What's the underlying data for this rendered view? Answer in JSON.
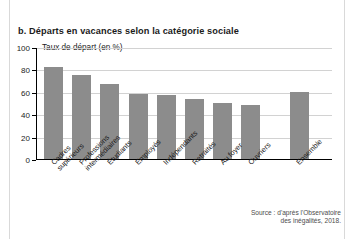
{
  "figure": {
    "title": "b. Départs en vacances selon la catégorie sociale",
    "axis_label": "Taux de départ (en %)",
    "source_line1": "Source : d'après l'Observatoire",
    "source_line2": "des inégalités, 2018.",
    "bar_color": "#8c8c8c",
    "text_color": "#1b1b1b",
    "grid_color": "#d2d2d2"
  },
  "chart_data": {
    "type": "bar",
    "title": "b. Départs en vacances selon la catégorie sociale",
    "xlabel": "",
    "ylabel": "Taux de départ (en %)",
    "ylim": [
      0,
      100
    ],
    "yticks": [
      0,
      20,
      40,
      60,
      80,
      100
    ],
    "grid": true,
    "legend": "none",
    "source": "Source : d'après l'Observatoire des inégalités, 2018.",
    "categories": [
      "Cadres supérieurs",
      "Professions intermédiaires",
      "Étudiants",
      "Employés",
      "Indépendants",
      "Retraités",
      "Au foyer",
      "Ouvriers",
      "Ensemble"
    ],
    "category_lines": [
      [
        "Cadres",
        "supérieurs"
      ],
      [
        "Professions",
        "intermédiaires"
      ],
      [
        "Étudiants"
      ],
      [
        "Employés"
      ],
      [
        "Indépendants"
      ],
      [
        "Retraités"
      ],
      [
        "Au foyer"
      ],
      [
        "Ouvriers"
      ],
      [
        "Ensemble"
      ]
    ],
    "values": [
      82,
      75,
      67,
      58,
      57,
      54,
      50,
      48,
      60
    ]
  }
}
